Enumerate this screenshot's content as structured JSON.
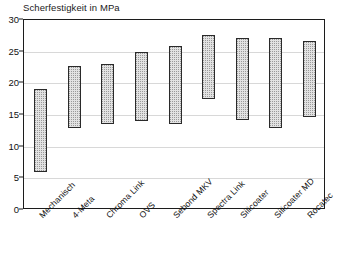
{
  "chart_data": {
    "type": "bar",
    "title": "Scherfestigkeit in MPa",
    "xlabel": "",
    "ylabel": "",
    "ylim": [
      0,
      30
    ],
    "yticks": [
      0,
      5,
      10,
      15,
      20,
      25,
      30
    ],
    "grid": true,
    "legend": "none",
    "note": "Floating range bars: each bar spans from a low value to a high value (range/whisker-style columns).",
    "categories": [
      "Mechanisch",
      "4-Meta",
      "Chroma Link",
      "OVS",
      "Sebond MKV",
      "Spectra Link",
      "Silicoater",
      "Silicoater MD",
      "Rocatec"
    ],
    "series": [
      {
        "name": "low",
        "values": [
          6.0,
          13.0,
          13.6,
          14.0,
          13.6,
          17.6,
          14.2,
          13.0,
          14.7
        ]
      },
      {
        "name": "high",
        "values": [
          19.1,
          22.7,
          23.1,
          24.9,
          25.9,
          27.6,
          27.1,
          27.1,
          26.7
        ]
      }
    ],
    "bars": [
      {
        "category": "Mechanisch",
        "low": 6.0,
        "high": 19.1
      },
      {
        "category": "4-Meta",
        "low": 13.0,
        "high": 22.7
      },
      {
        "category": "Chroma Link",
        "low": 13.6,
        "high": 23.1
      },
      {
        "category": "OVS",
        "low": 14.0,
        "high": 24.9
      },
      {
        "category": "Sebond MKV",
        "low": 13.6,
        "high": 25.9
      },
      {
        "category": "Spectra Link",
        "low": 17.6,
        "high": 27.6
      },
      {
        "category": "Silicoater",
        "low": 14.2,
        "high": 27.1
      },
      {
        "category": "Silicoater MD",
        "low": 13.0,
        "high": 27.1
      },
      {
        "category": "Rocatec",
        "low": 14.7,
        "high": 26.7
      }
    ],
    "colors": {
      "bar_fill": "#e2e2e2",
      "bar_border": "#2a2a2a",
      "gridline": "#d8d8d8",
      "axis": "#1c1c1c",
      "text": "#111111",
      "background": "#ffffff"
    }
  }
}
